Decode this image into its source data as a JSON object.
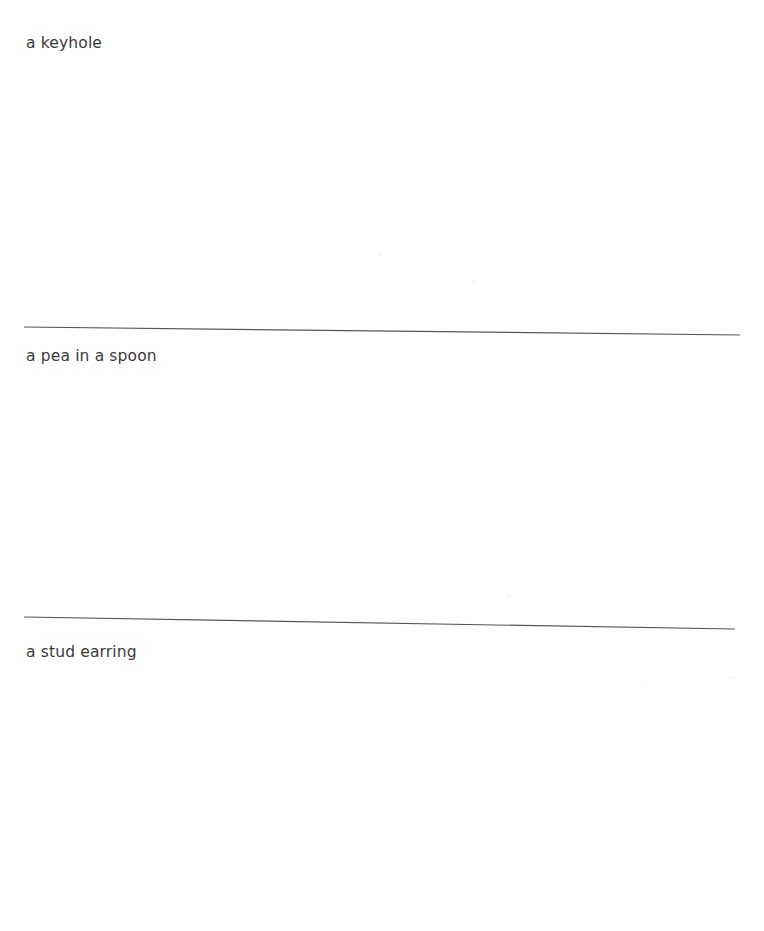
{
  "page": {
    "background_color": "#ffffff",
    "width": 764,
    "height": 931
  },
  "captions": [
    {
      "text": "a keyhole",
      "color": "#3a3a3c"
    },
    {
      "text": "a pea in a spoon",
      "color": "#3a3a3c"
    },
    {
      "text": "a stud earring",
      "color": "#3a3a3c"
    }
  ],
  "separators": [
    {
      "name": "divider-rule-1",
      "color": "#555558",
      "x1": 24,
      "y1": 327,
      "x2": 740,
      "y2": 335
    },
    {
      "name": "divider-rule-2",
      "color": "#555558",
      "x1": 24,
      "y1": 617,
      "x2": 735,
      "y2": 629
    }
  ],
  "artifacts": [
    {
      "x": 378,
      "y": 252,
      "size": 3,
      "color": "#f4f4f6"
    },
    {
      "x": 472,
      "y": 280,
      "size": 3,
      "color": "#f5f5f7"
    },
    {
      "x": 508,
      "y": 594,
      "size": 3,
      "color": "#f4f4f6"
    },
    {
      "x": 506,
      "y": 597,
      "size": 2,
      "color": "#f5f5f7"
    },
    {
      "x": 645,
      "y": 682,
      "size": 2,
      "color": "#f6f6f8"
    },
    {
      "x": 729,
      "y": 676,
      "size": 3,
      "color": "#f5f5f7"
    }
  ]
}
